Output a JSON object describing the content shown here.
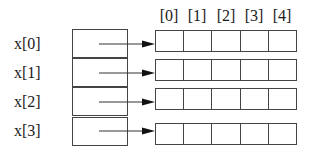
{
  "diagram": {
    "type": "2d-array-pointer-diagram",
    "column_labels": [
      "[0]",
      "[1]",
      "[2]",
      "[3]",
      "[4]"
    ],
    "rows": [
      {
        "label": "x[0]",
        "cells": [
          "",
          "",
          "",
          "",
          ""
        ]
      },
      {
        "label": "x[1]",
        "cells": [
          "",
          "",
          "",
          "",
          ""
        ]
      },
      {
        "label": "x[2]",
        "cells": [
          "",
          "",
          "",
          "",
          ""
        ]
      },
      {
        "label": "x[3]",
        "cells": [
          "",
          "",
          "",
          "",
          ""
        ]
      }
    ],
    "colors": {
      "line": "#444444",
      "text": "#1a1a1a",
      "background": "#ffffff"
    }
  }
}
